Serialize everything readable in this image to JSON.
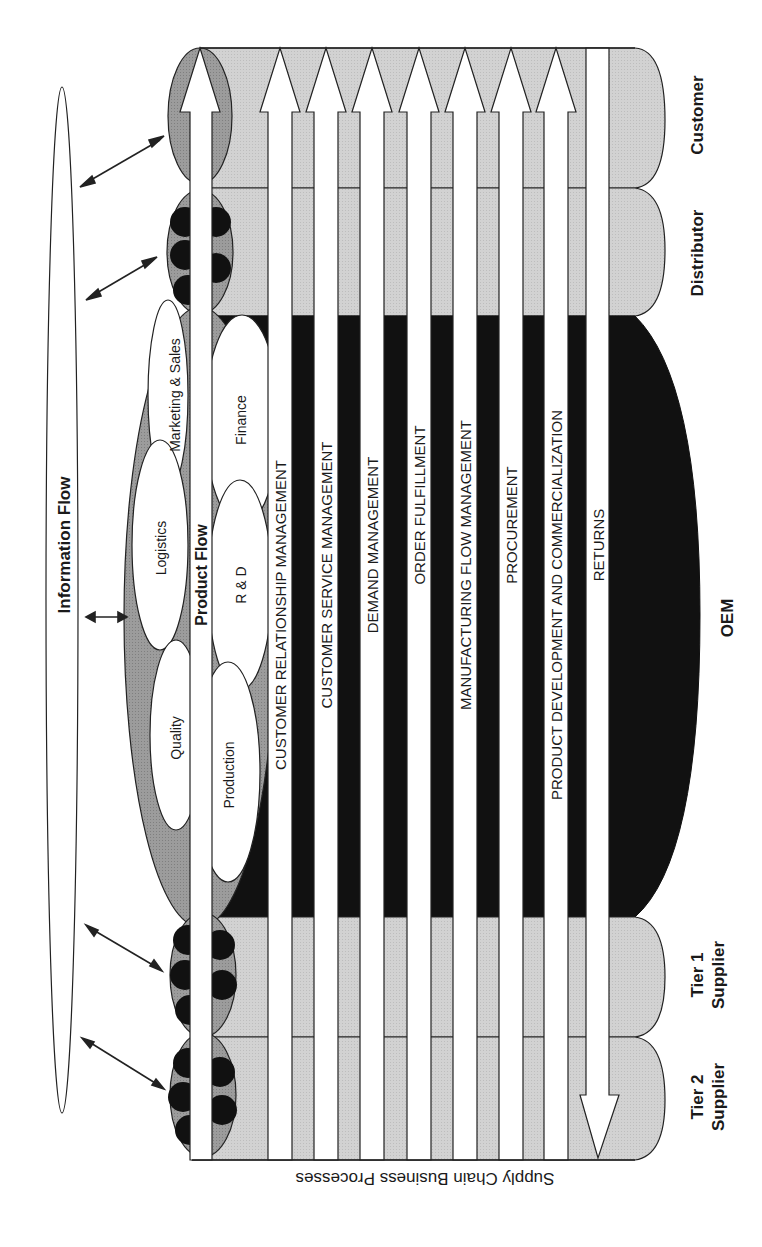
{
  "diagram": {
    "title": "Supply Chain Business Processes",
    "information_flow_label": "Information Flow",
    "product_flow_label": "Product Flow",
    "stages": [
      {
        "id": "customer",
        "label": "Customer"
      },
      {
        "id": "distributor",
        "label": "Distributor"
      },
      {
        "id": "oem",
        "label": "OEM"
      },
      {
        "id": "tier1",
        "label_line1": "Tier 1",
        "label_line2": "Supplier"
      },
      {
        "id": "tier2",
        "label_line1": "Tier 2",
        "label_line2": "Supplier"
      }
    ],
    "functions": [
      {
        "label": "Quality"
      },
      {
        "label": "Logistics"
      },
      {
        "label": "Marketing & Sales"
      },
      {
        "label": "Production"
      },
      {
        "label": "R & D"
      },
      {
        "label": "Finance"
      }
    ],
    "processes": [
      {
        "label": "CUSTOMER RELATIONSHIP MANAGEMENT",
        "direction": "toward-customer"
      },
      {
        "label": "CUSTOMER SERVICE MANAGEMENT",
        "direction": "toward-customer"
      },
      {
        "label": "DEMAND MANAGEMENT",
        "direction": "toward-customer"
      },
      {
        "label": "ORDER FULFILLMENT",
        "direction": "toward-customer"
      },
      {
        "label": "MANUFACTURING FLOW MANAGEMENT",
        "direction": "toward-customer"
      },
      {
        "label": "PROCUREMENT",
        "direction": "toward-customer"
      },
      {
        "label": "PRODUCT DEVELOPMENT AND COMMERCIALIZATION",
        "direction": "toward-customer"
      },
      {
        "label": "RETURNS",
        "direction": "toward-suppliers"
      }
    ],
    "colors": {
      "light_band": "#cfcfcf",
      "medium": "#9a9a9a",
      "dark": "#111111",
      "arrow": "#ffffff",
      "outline": "#222222"
    }
  }
}
